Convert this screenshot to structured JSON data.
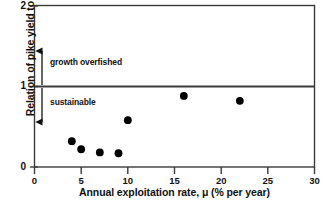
{
  "chart_data": {
    "type": "scatter",
    "title": "",
    "xlabel": "Annual exploitation rate, μ (% per year)",
    "ylabel": "Relation of pike yield to MSY",
    "xlim": [
      0,
      30
    ],
    "ylim": [
      0,
      2
    ],
    "xticks": [
      "0",
      "5",
      "10",
      "15",
      "20",
      "25",
      "30"
    ],
    "xtick_values": [
      0,
      5,
      10,
      15,
      20,
      25,
      30
    ],
    "yticks": [
      "0",
      "1",
      "2"
    ],
    "ytick_values": [
      0,
      1,
      2
    ],
    "grid": false,
    "legend": "none",
    "marker": "filled-circle",
    "marker_color": "#000000",
    "axis_color": "#3a3a3a",
    "points": [
      {
        "x": 4,
        "y": 0.32
      },
      {
        "x": 5,
        "y": 0.22
      },
      {
        "x": 7,
        "y": 0.18
      },
      {
        "x": 9,
        "y": 0.17
      },
      {
        "x": 10,
        "y": 0.58
      },
      {
        "x": 16,
        "y": 0.88
      },
      {
        "x": 22,
        "y": 0.82
      }
    ],
    "reference_line": {
      "y": 1,
      "label": "MSY reference",
      "color": "#3a3a3a"
    },
    "annotations": [
      {
        "text": "growth overfished",
        "x": 1.6,
        "y": 1.28,
        "arrow": "up",
        "arrow_x": 0.9,
        "arrow_from": 1.02,
        "arrow_to": 1.45
      },
      {
        "text": "sustainable",
        "x": 1.6,
        "y": 0.74,
        "arrow": "down",
        "arrow_x": 0.9,
        "arrow_from": 0.98,
        "arrow_to": 0.56
      }
    ]
  }
}
